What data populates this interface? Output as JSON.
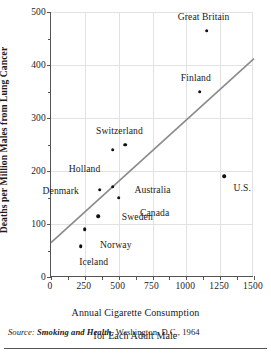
{
  "chart_data": {
    "type": "scatter",
    "title": "",
    "xlabel": "Annual Cigarette Consumption for Each Adult Male",
    "ylabel": "Deaths per Million Males from Lung Cancer",
    "xlim": [
      0,
      1500
    ],
    "ylim": [
      0,
      500
    ],
    "xticks": [
      0,
      250,
      500,
      750,
      1000,
      1250,
      1500
    ],
    "yticks": [
      0,
      100,
      200,
      300,
      400,
      500
    ],
    "x_minor_step": 125,
    "y_minor_step": 50,
    "grid": true,
    "legend": "none",
    "points": [
      {
        "label": "Iceland",
        "x": 220,
        "y": 58,
        "label_dx": 14,
        "label_dy": 15
      },
      {
        "label": "Norway",
        "x": 250,
        "y": 90,
        "label_dx": 32,
        "label_dy": 15
      },
      {
        "label": "Sweden",
        "x": 350,
        "y": 115,
        "label_dx": 40,
        "label_dy": 0
      },
      {
        "label": "Canada",
        "x": 500,
        "y": 150,
        "label_dx": 37,
        "label_dy": 14
      },
      {
        "label": "Denmark",
        "x": 360,
        "y": 165,
        "label_dx": -38,
        "label_dy": 0
      },
      {
        "label": "Australia",
        "x": 455,
        "y": 170,
        "label_dx": 41,
        "label_dy": 2
      },
      {
        "label": "U.S.",
        "x": 1280,
        "y": 190,
        "label_dx": 19,
        "label_dy": 11
      },
      {
        "label": "Holland",
        "x": 455,
        "y": 240,
        "label_dx": -27,
        "label_dy": 18
      },
      {
        "label": "Switzerland",
        "x": 550,
        "y": 250,
        "label_dx": -5,
        "label_dy": -15
      },
      {
        "label": "Finland",
        "x": 1100,
        "y": 350,
        "label_dx": -3,
        "label_dy": -15
      },
      {
        "label": "Great Britain",
        "x": 1150,
        "y": 465,
        "label_dx": -2,
        "label_dy": -15
      }
    ],
    "trend_line": {
      "x0": 0,
      "y0": 65,
      "x1": 1500,
      "y1": 412,
      "color": "#8a8a8a"
    },
    "colors": {
      "point": "#111111",
      "axis": "#555555",
      "grid": "#e2e2e2",
      "trend": "#8a8a8a",
      "text": "#1a1a1a"
    }
  },
  "source": {
    "prefix": "Source:",
    "work": "Smoking and Health",
    "rest": ", Washington, D.C., 1964"
  }
}
